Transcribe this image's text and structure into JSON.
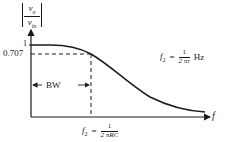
{
  "diagram": {
    "type": "low-pass frequency response",
    "y_axis": {
      "label_numerator": "v",
      "label_numerator_sub": "o",
      "label_denominator": "v",
      "label_denominator_sub": "in",
      "ticks": [
        "1",
        "0.707"
      ]
    },
    "x_axis": {
      "label": "f"
    },
    "bandwidth_label": "BW",
    "cutoff_formula": {
      "lhs": "f",
      "lhs_sub": "2",
      "equals": "=",
      "numerator": "1",
      "denominator": "2 πRC"
    },
    "tau_formula": {
      "lhs": "f",
      "lhs_sub": "2",
      "equals": "=",
      "numerator": "1",
      "denominator": "2 πτ",
      "unit": "Hz"
    },
    "colors": {
      "ink": "#1a1a1a",
      "background": "#ffffff"
    }
  }
}
